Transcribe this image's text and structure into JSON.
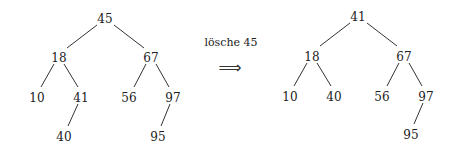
{
  "caption": "lösche 45",
  "arrow": "⟹",
  "left_tree": {
    "nodes": [
      {
        "id": "n45",
        "label": "45",
        "x": 105,
        "y": 19
      },
      {
        "id": "n18",
        "label": "18",
        "x": 59,
        "y": 58
      },
      {
        "id": "n67",
        "label": "67",
        "x": 151,
        "y": 58
      },
      {
        "id": "n10",
        "label": "10",
        "x": 37,
        "y": 98
      },
      {
        "id": "n41",
        "label": "41",
        "x": 81,
        "y": 98
      },
      {
        "id": "n56",
        "label": "56",
        "x": 129,
        "y": 98
      },
      {
        "id": "n97",
        "label": "97",
        "x": 173,
        "y": 98
      },
      {
        "id": "n40",
        "label": "40",
        "x": 64,
        "y": 137
      },
      {
        "id": "n95",
        "label": "95",
        "x": 158,
        "y": 137
      }
    ],
    "edges": [
      {
        "x1": 97,
        "y1": 25,
        "x2": 67,
        "y2": 48
      },
      {
        "x1": 114,
        "y1": 25,
        "x2": 144,
        "y2": 48
      },
      {
        "x1": 54,
        "y1": 64,
        "x2": 41,
        "y2": 87
      },
      {
        "x1": 64,
        "y1": 64,
        "x2": 78,
        "y2": 87
      },
      {
        "x1": 146,
        "y1": 64,
        "x2": 134,
        "y2": 87
      },
      {
        "x1": 156,
        "y1": 64,
        "x2": 169,
        "y2": 87
      },
      {
        "x1": 78,
        "y1": 104,
        "x2": 68,
        "y2": 126
      },
      {
        "x1": 170,
        "y1": 104,
        "x2": 161,
        "y2": 126
      }
    ]
  },
  "right_tree": {
    "nodes": [
      {
        "id": "m41",
        "label": "41",
        "x": 358,
        "y": 17
      },
      {
        "id": "m18",
        "label": "18",
        "x": 312,
        "y": 57
      },
      {
        "id": "m67",
        "label": "67",
        "x": 404,
        "y": 57
      },
      {
        "id": "m10",
        "label": "10",
        "x": 290,
        "y": 97
      },
      {
        "id": "m40",
        "label": "40",
        "x": 334,
        "y": 97
      },
      {
        "id": "m56",
        "label": "56",
        "x": 382,
        "y": 97
      },
      {
        "id": "m97",
        "label": "97",
        "x": 426,
        "y": 97
      },
      {
        "id": "m95",
        "label": "95",
        "x": 411,
        "y": 135
      }
    ],
    "edges": [
      {
        "x1": 350,
        "y1": 23,
        "x2": 320,
        "y2": 46
      },
      {
        "x1": 367,
        "y1": 23,
        "x2": 397,
        "y2": 46
      },
      {
        "x1": 307,
        "y1": 63,
        "x2": 294,
        "y2": 86
      },
      {
        "x1": 317,
        "y1": 63,
        "x2": 331,
        "y2": 86
      },
      {
        "x1": 399,
        "y1": 63,
        "x2": 387,
        "y2": 86
      },
      {
        "x1": 409,
        "y1": 63,
        "x2": 422,
        "y2": 86
      },
      {
        "x1": 423,
        "y1": 103,
        "x2": 414,
        "y2": 124
      }
    ]
  }
}
